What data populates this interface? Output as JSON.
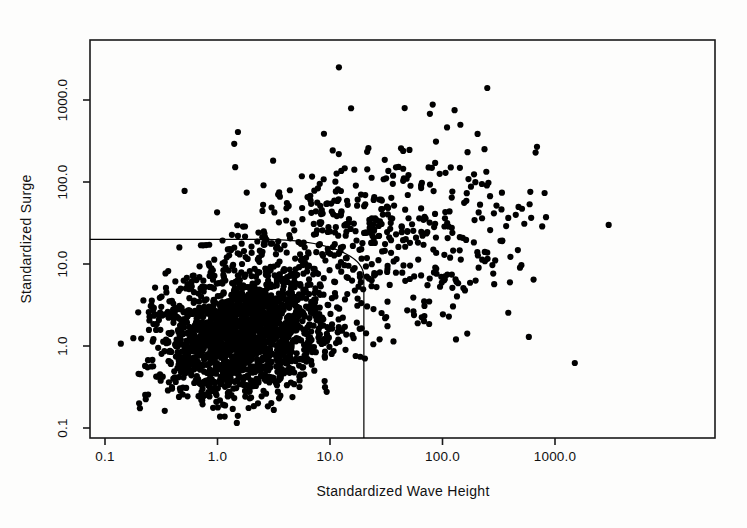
{
  "chart_data": {
    "type": "scatter",
    "title": "",
    "xlabel": "Standardized Wave Height",
    "ylabel": "Standardized Surge",
    "xscale": "log",
    "yscale": "log",
    "xlim": [
      0.085,
      3600
    ],
    "ylim": [
      0.085,
      3600
    ],
    "grid": false,
    "legend": "none",
    "marker": {
      "shape": "circle",
      "color": "#000000",
      "size_px": 6
    },
    "xticks": [
      0.1,
      1.0,
      10.0,
      100.0,
      1000.0
    ],
    "xtick_labels": [
      "0.1",
      "1.0",
      "10.0",
      "100.0",
      "1000.0"
    ],
    "yticks": [
      0.1,
      1.0,
      10.0,
      100.0,
      1000.0
    ],
    "ytick_labels": [
      "0.1",
      "1.0",
      "10.0",
      "100.0",
      "1000.0"
    ],
    "n_points": 2400,
    "annotations": [
      {
        "kind": "threshold-boundary",
        "description": "Joint exceedance threshold: horizontal line at surge = 20 from left edge, curved corner, vertical line at wave height = 20 down to bottom axis",
        "surge_threshold": 20,
        "wave_height_threshold": 20,
        "line_color": "#000000",
        "line_width_px": 1.2
      }
    ],
    "clusters": [
      {
        "name": "main-body",
        "n": 1850,
        "x_center_log10": 0.22,
        "x_sigma_log10": 0.38,
        "y_center_log10": 0.16,
        "y_sigma_log10": 0.38,
        "correlation": 0.18
      },
      {
        "name": "upper-tail",
        "n": 300,
        "x_center_log10": 0.85,
        "x_sigma_log10": 0.55,
        "y_center_log10": 1.35,
        "y_sigma_log10": 0.55,
        "correlation": 0.3
      },
      {
        "name": "right-tail",
        "n": 250,
        "x_center_log10": 1.85,
        "x_sigma_log10": 0.55,
        "y_center_log10": 1.2,
        "y_sigma_log10": 0.6,
        "correlation": 0.35
      }
    ],
    "notable_points": [
      {
        "x": 12.0,
        "y": 2500,
        "note": "highest surge outlier"
      },
      {
        "x": 250.0,
        "y": 1400,
        "note": "upper right outlier"
      },
      {
        "x": 3000.0,
        "y": 30,
        "note": "largest wave height outlier"
      },
      {
        "x": 1500.0,
        "y": 0.62,
        "note": "isolated low surge, high wave height"
      }
    ]
  },
  "axes": {
    "x_title": "Standardized Wave Height",
    "y_title": "Standardized Surge",
    "x_tick_labels": [
      "0.1",
      "1.0",
      "10.0",
      "100.0",
      "1000.0"
    ],
    "y_tick_labels": [
      "0.1",
      "1.0",
      "10.0",
      "100.0",
      "1000.0"
    ]
  },
  "colors": {
    "background": "#fdfdfc",
    "frame": "#1a1a1a",
    "marker": "#000000",
    "threshold_line": "#000000"
  }
}
